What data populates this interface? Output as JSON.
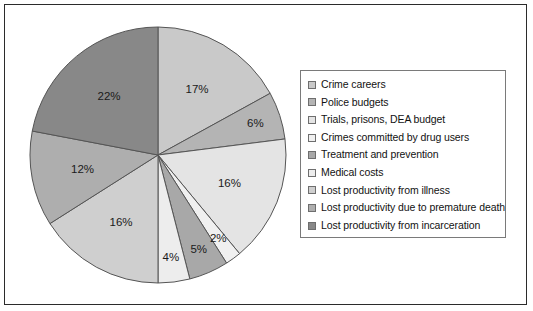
{
  "chart_data": {
    "type": "pie",
    "title": "",
    "start_angle_deg": 0,
    "direction": "clockwise",
    "legend_position": "right",
    "unit": "%",
    "categories": [
      "Crime careers",
      "Police budgets",
      "Trials, prisons, DEA budget",
      "Crimes committed by drug users",
      "Treatment and prevention",
      "Medical costs",
      "Lost productivity from illness",
      "Lost productivity due to premature death",
      "Lost productivity from incarceration"
    ],
    "values": [
      17,
      6,
      16,
      2,
      5,
      4,
      16,
      12,
      22
    ],
    "labels": [
      "17%",
      "6%",
      "16%",
      "2%",
      "5%",
      "4%",
      "16%",
      "12%",
      "22%"
    ],
    "colors": [
      "#c9c9c9",
      "#b4b4b4",
      "#e4e4e4",
      "#f0f0f0",
      "#a8a8a8",
      "#ededed",
      "#cfcfcf",
      "#aeaeae",
      "#888888"
    ],
    "label_text_colors": [
      "#1a1a1a",
      "#1a1a1a",
      "#1a1a1a",
      "#1a1a1a",
      "#1a1a1a",
      "#1a1a1a",
      "#1a1a1a",
      "#1a1a1a",
      "#ffffff"
    ],
    "slice_outline_color": "#555555",
    "background_color": "#ffffff",
    "frame_color": "#2b2b2b"
  },
  "legend": {
    "items": [
      {
        "label": "Crime careers",
        "color": "#c9c9c9"
      },
      {
        "label": "Police budgets",
        "color": "#b4b4b4"
      },
      {
        "label": "Trials, prisons, DEA budget",
        "color": "#e4e4e4"
      },
      {
        "label": "Crimes committed by drug users",
        "color": "#f0f0f0"
      },
      {
        "label": "Treatment and prevention",
        "color": "#a8a8a8"
      },
      {
        "label": "Medical costs",
        "color": "#ededed"
      },
      {
        "label": "Lost productivity from illness",
        "color": "#cfcfcf"
      },
      {
        "label": "Lost productivity due to premature death",
        "color": "#aeaeae"
      },
      {
        "label": "Lost productivity from incarceration",
        "color": "#888888"
      }
    ]
  }
}
